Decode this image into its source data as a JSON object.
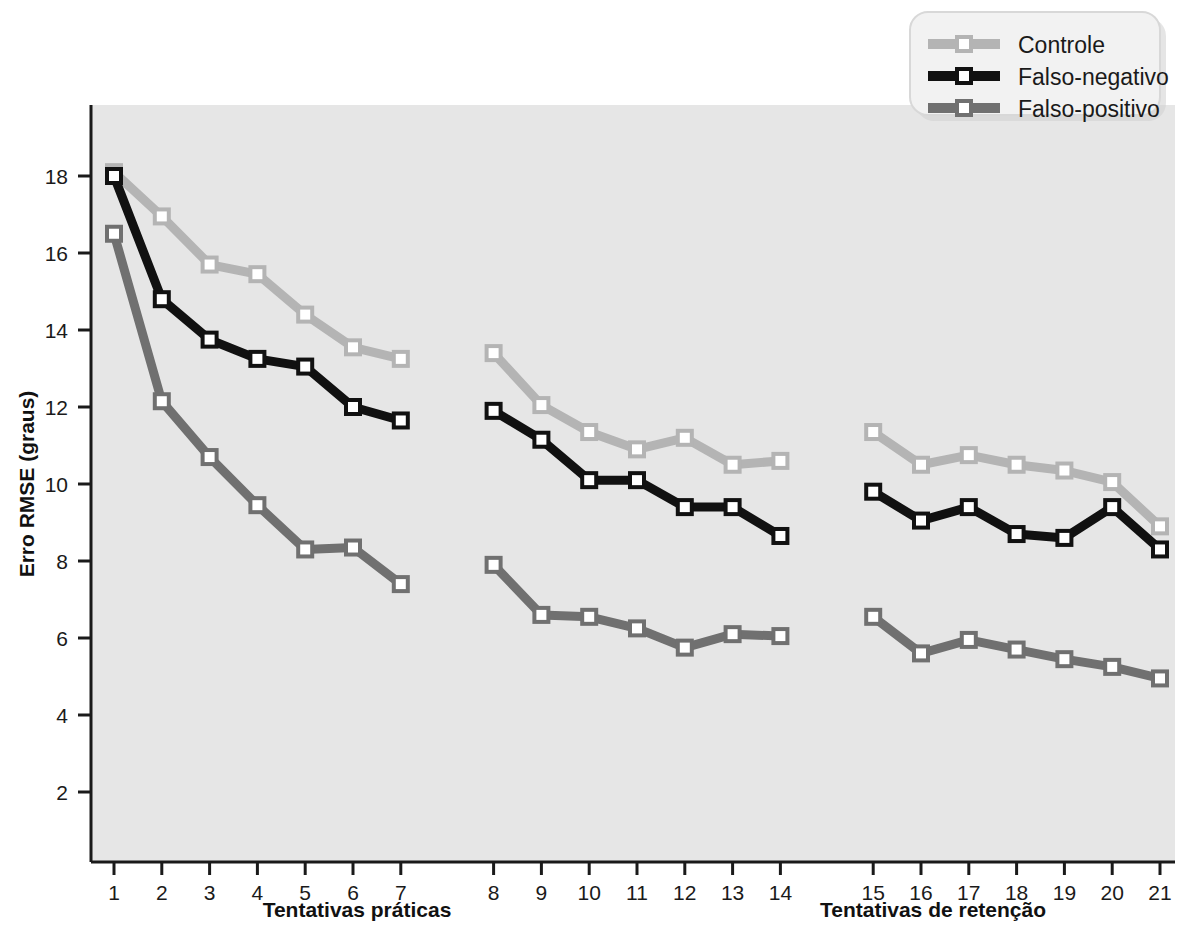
{
  "chart_data": {
    "type": "line",
    "title": "",
    "xlabel": "Tentativas práticas / Tentativas de retenção",
    "ylabel": "Erro RMSE (graus)",
    "x": [
      1,
      2,
      3,
      4,
      5,
      6,
      7,
      8,
      9,
      10,
      11,
      12,
      13,
      14,
      15,
      16,
      17,
      18,
      19,
      20,
      21
    ],
    "xtick_labels": [
      "1",
      "2",
      "3",
      "4",
      "5",
      "6",
      "7",
      "8",
      "9",
      "10",
      "11",
      "12",
      "13",
      "14",
      "15",
      "16",
      "17",
      "18",
      "19",
      "20",
      "21"
    ],
    "ytick_labels": [
      "2",
      "4",
      "6",
      "8",
      "10",
      "12",
      "14",
      "16",
      "18"
    ],
    "yticks": [
      2,
      4,
      6,
      8,
      10,
      12,
      14,
      16,
      18
    ],
    "ylim": [
      0.6,
      19.4
    ],
    "grid": false,
    "legend_position": "top-right",
    "block_labels": [
      {
        "text": "Tentativas práticas",
        "trials": [
          1,
          2,
          3,
          4,
          5,
          6,
          7,
          8,
          9,
          10,
          11,
          12,
          13,
          14
        ]
      },
      {
        "text": "Tentativas de retenção",
        "trials": [
          15,
          16,
          17,
          18,
          19,
          20,
          21
        ]
      }
    ],
    "series": [
      {
        "name": "Controle",
        "color": "#b4b4b4",
        "values": [
          18.1,
          16.95,
          15.7,
          15.45,
          14.4,
          13.55,
          13.25,
          13.4,
          12.05,
          11.35,
          10.9,
          11.2,
          10.5,
          10.6,
          11.35,
          10.5,
          10.75,
          10.5,
          10.35,
          10.05,
          8.9
        ]
      },
      {
        "name": "Falso-negativo",
        "color": "#111111",
        "values": [
          18.0,
          14.8,
          13.75,
          13.25,
          13.05,
          12.0,
          11.65,
          11.9,
          11.15,
          10.1,
          10.1,
          9.4,
          9.4,
          8.65,
          9.8,
          9.05,
          9.4,
          8.7,
          8.6,
          9.4,
          8.3
        ]
      },
      {
        "name": "Falso-positivo",
        "color": "#707070",
        "values": [
          16.5,
          12.15,
          10.7,
          9.45,
          8.3,
          8.35,
          7.4,
          7.9,
          6.6,
          6.55,
          6.25,
          5.75,
          6.1,
          6.05,
          6.55,
          5.6,
          5.95,
          5.7,
          5.45,
          5.25,
          4.95
        ]
      }
    ]
  },
  "legend": {
    "entries": [
      {
        "label": "Controle"
      },
      {
        "label": "Falso-negativo"
      },
      {
        "label": "Falso-positivo"
      }
    ]
  },
  "axes": {
    "ylabel": "Erro RMSE (graus)",
    "xlabel_left": "Tentativas práticas",
    "xlabel_right": "Tentativas de retenção"
  },
  "colors": {
    "controle": "#b4b4b4",
    "falso_negativo": "#111111",
    "falso_positivo": "#707070",
    "plot_background": "#e6e6e6",
    "axis": "#1a1a1a",
    "marker_fill": "#ffffff",
    "legend_background": "#f2f2f2"
  }
}
